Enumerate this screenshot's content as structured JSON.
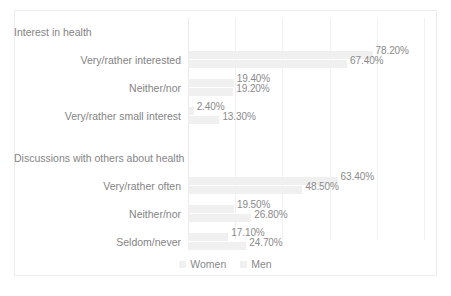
{
  "chart_data": {
    "type": "bar",
    "orientation": "horizontal",
    "title": "",
    "xlabel": "",
    "ylabel": "",
    "xlim": [
      0,
      100
    ],
    "grid": true,
    "gridlines_percent": [
      0,
      20,
      40,
      60,
      80,
      100
    ],
    "legend_position": "bottom",
    "value_suffix": "%",
    "groups": [
      {
        "name": "Interest in health",
        "categories": [
          "Very/rather interested",
          "Neither/nor",
          "Very/rather small interest"
        ],
        "series": [
          {
            "name": "Women",
            "values": [
              78.2,
              19.4,
              2.4
            ]
          },
          {
            "name": "Men",
            "values": [
              67.4,
              19.2,
              13.3
            ]
          }
        ]
      },
      {
        "name": "Discussions with others about health",
        "categories": [
          "Very/rather often",
          "Neither/nor",
          "Seldom/never"
        ],
        "series": [
          {
            "name": "Very/rather often Women",
            "values": [
              63.4,
              19.5,
              17.1
            ]
          },
          {
            "name": "Men",
            "values": [
              48.5,
              26.8,
              24.7
            ]
          }
        ]
      }
    ],
    "series_names": [
      "Women",
      "Men"
    ],
    "colors": {
      "women": "#f0f0f0",
      "men": "#f2f2f2",
      "text": "#8a8a8a",
      "grid": "#f1f1f1"
    }
  },
  "rows": [
    {
      "kind": "group",
      "label": "Interest in health"
    },
    {
      "kind": "data",
      "label": "Very/rather interested",
      "women": 78.2,
      "men": 67.4,
      "women_text": "78.20%",
      "men_text": "67.40%"
    },
    {
      "kind": "data",
      "label": "Neither/nor",
      "women": 19.4,
      "men": 19.2,
      "women_text": "19.40%",
      "men_text": "19.20%"
    },
    {
      "kind": "data",
      "label": "Very/rather small interest",
      "women": 2.4,
      "men": 13.3,
      "women_text": "2.40%",
      "men_text": "13.30%"
    },
    {
      "kind": "spacer",
      "label": ""
    },
    {
      "kind": "group",
      "label": "Discussions with others about health"
    },
    {
      "kind": "data",
      "label": "Very/rather often",
      "women": 63.4,
      "men": 48.5,
      "women_text": "63.40%",
      "men_text": "48.50%"
    },
    {
      "kind": "data",
      "label": "Neither/nor",
      "women": 19.5,
      "men": 26.8,
      "women_text": "19.50%",
      "men_text": "26.80%"
    },
    {
      "kind": "data",
      "label": "Seldom/never",
      "women": 17.1,
      "men": 24.7,
      "women_text": "17.10%",
      "men_text": "24.70%"
    }
  ],
  "legend": {
    "items": [
      {
        "label": "Women"
      },
      {
        "label": "Men"
      }
    ]
  }
}
